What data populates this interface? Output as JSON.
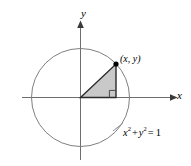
{
  "figure": {
    "type": "unit-circle-diagram",
    "title": "",
    "axes": {
      "x_label": "x",
      "y_label": "y",
      "origin_px": [
        80.5,
        97.5
      ],
      "x_axis_from_px": [
        22,
        97.5
      ],
      "x_axis_to_px": [
        176,
        97.5
      ],
      "y_axis_from_px": [
        80.5,
        22
      ],
      "y_axis_to_px": [
        80.5,
        160
      ],
      "arrowheads": [
        "x-positive",
        "y-positive"
      ]
    },
    "circle": {
      "center_px": [
        80.5,
        97.5
      ],
      "radius_px": 49,
      "equation": "x2 + y2 = 1",
      "stroke": "#808080"
    },
    "point": {
      "label": "(x, y)",
      "px": [
        116,
        64
      ],
      "marker": "filled-dot"
    },
    "triangle": {
      "vertices_px": [
        [
          80.5,
          97.5
        ],
        [
          116,
          97.5
        ],
        [
          116,
          64
        ]
      ],
      "fill": "#c9c9c9",
      "stroke": "#2a2a2a",
      "right_angle_marker": true,
      "right_angle_at_px": [
        116,
        97.5
      ]
    },
    "equation_parts": {
      "x_var": "x",
      "x_exp": "2",
      "plus": "+",
      "y_var": "y",
      "y_exp": "2",
      "equals": "=",
      "one": "1"
    },
    "colors": {
      "background": "#ffffff",
      "circle_stroke": "#808080",
      "axis_stroke": "#6e6e6e",
      "triangle_fill": "#c9c9c9",
      "triangle_stroke": "#2a2a2a",
      "text": "#000000"
    }
  }
}
